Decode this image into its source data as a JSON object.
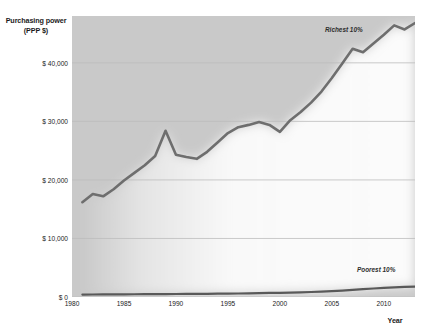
{
  "chart_data": {
    "type": "line",
    "title": "",
    "xlabel": "Year",
    "ylabel": "Purchasing power (PPP $)",
    "ylabel_line1": "Purchasing power",
    "ylabel_line2": "(PPP $)",
    "xlim": [
      1980,
      2013
    ],
    "ylim": [
      0,
      48000
    ],
    "grid": true,
    "legend_position": "inline-annotation",
    "ytick_labels": [
      "$ 0",
      "$ 10,000",
      "$ 20,000",
      "$ 30,000",
      "$ 40,000"
    ],
    "ytick_values": [
      0,
      10000,
      20000,
      30000,
      40000
    ],
    "xtick_labels": [
      "1980",
      "1985",
      "1990",
      "1995",
      "2000",
      "2005",
      "2010"
    ],
    "xtick_values": [
      1980,
      1985,
      1990,
      1995,
      2000,
      2005,
      2010
    ],
    "x": [
      1981,
      1982,
      1983,
      1984,
      1985,
      1986,
      1987,
      1988,
      1989,
      1990,
      1991,
      1992,
      1993,
      1994,
      1995,
      1996,
      1997,
      1998,
      1999,
      2000,
      2001,
      2002,
      2003,
      2004,
      2005,
      2006,
      2007,
      2008,
      2009,
      2010,
      2011,
      2012,
      2013
    ],
    "series": [
      {
        "name": "Richest 10%",
        "color": "#6e6e6e",
        "values": [
          16200,
          17600,
          17200,
          18400,
          19900,
          21200,
          22500,
          24100,
          28400,
          24300,
          23900,
          23600,
          24800,
          26400,
          28000,
          29000,
          29400,
          29900,
          29400,
          28200,
          30200,
          31600,
          33200,
          35100,
          37400,
          39900,
          42400,
          41800,
          43300,
          44800,
          46400,
          45700,
          46800
        ]
      },
      {
        "name": "Poorest 10%",
        "color": "#595959",
        "values": [
          420,
          430,
          440,
          450,
          460,
          470,
          480,
          490,
          500,
          510,
          520,
          530,
          540,
          560,
          580,
          600,
          630,
          660,
          690,
          720,
          760,
          800,
          850,
          920,
          1000,
          1100,
          1220,
          1340,
          1450,
          1560,
          1660,
          1720,
          1760
        ]
      }
    ],
    "annotations": [
      {
        "text": "Richest 10%",
        "x": 2006,
        "y": 45000
      },
      {
        "text": "Poorest 10%",
        "x": 2009,
        "y": 4400
      }
    ]
  },
  "colors": {
    "plot_background": "#c9c9c9",
    "gap_wedge": "#fbfbfb",
    "gridline": "#bdbdbd",
    "richest_line": "#6e6e6e",
    "poorest_line": "#595959",
    "text": "#1b1b1b"
  }
}
